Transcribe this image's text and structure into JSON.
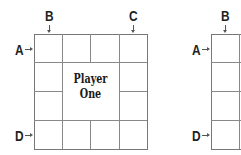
{
  "diagram": {
    "board_one": {
      "title_line1": "Player",
      "title_line2": "One",
      "rows": 4,
      "cols": 4,
      "merged_center": "2x2",
      "markers": {
        "A": "A",
        "B": "B",
        "C": "C",
        "D": "D"
      }
    },
    "board_two": {
      "markers": {
        "A": "A",
        "B": "B",
        "D": "D"
      }
    },
    "colors": {
      "line": "#888888",
      "text": "#222222",
      "background": "#ffffff"
    }
  }
}
